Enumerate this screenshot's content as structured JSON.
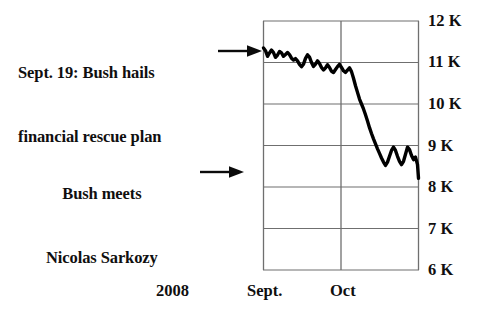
{
  "chart_data": {
    "type": "line",
    "title": "",
    "subtitle": "",
    "xlabel": "2008",
    "ylabel": "",
    "ylim": [
      6000,
      12000
    ],
    "ytick_labels": [
      "12 K",
      "11 K",
      "10 K",
      "9 K",
      "8 K",
      "7 K",
      "6 K"
    ],
    "ytick_values": [
      12000,
      11000,
      10000,
      9000,
      8000,
      7000,
      6000
    ],
    "xtick_labels": [
      "Sept.",
      "Oct"
    ],
    "grid": true,
    "legend": null,
    "line_color": "#000000",
    "series": [
      {
        "name": "Dow Jones Industrial Average",
        "x": [
          0.0,
          1.2,
          2.4,
          3.6,
          4.8,
          6.0,
          7.2,
          8.4,
          9.6,
          10.8,
          12.0,
          13.2,
          14.4,
          15.6,
          16.8,
          18.0,
          19.2,
          20.4,
          21.6,
          22.8,
          24.0,
          25.2,
          26.4,
          27.6,
          28.8,
          30.0,
          31.2,
          32.4,
          33.6,
          34.8,
          36.0,
          37.2,
          38.4,
          39.6,
          40.8,
          42.0,
          43.2,
          44.4,
          45.6,
          46.8,
          48.0,
          49.2,
          50.4,
          51.6,
          52.8,
          54.0,
          55.2,
          56.4,
          57.6,
          58.8,
          60.0,
          61.2,
          62.4,
          63.6,
          64.8,
          66.0,
          67.2,
          68.4,
          69.6,
          70.8,
          72.0,
          73.2,
          74.4,
          75.6,
          76.8,
          78.0,
          79.2,
          80.4,
          81.6,
          82.8,
          84.0,
          85.2,
          86.4,
          87.6,
          88.8,
          90.0,
          91.2,
          92.4,
          93.0
        ],
        "values": [
          11350,
          11285,
          11150,
          11230,
          11300,
          11240,
          11125,
          11180,
          11265,
          11230,
          11150,
          11195,
          11240,
          11190,
          11105,
          11060,
          11095,
          11040,
          10955,
          10900,
          10960,
          11100,
          11185,
          11130,
          11000,
          10905,
          10960,
          11040,
          10975,
          10880,
          10820,
          10870,
          10945,
          10880,
          10790,
          10760,
          10830,
          10900,
          10955,
          10880,
          10800,
          10760,
          10815,
          10870,
          10780,
          10620,
          10440,
          10280,
          10120,
          10000,
          9880,
          9740,
          9590,
          9430,
          9290,
          9160,
          9040,
          8920,
          8810,
          8700,
          8600,
          8520,
          8600,
          8740,
          8880,
          8960,
          8880,
          8740,
          8620,
          8540,
          8620,
          8790,
          8960,
          8900,
          8760,
          8660,
          8720,
          8540,
          8210
        ]
      }
    ],
    "annotations": [
      {
        "id": "rescue-plan",
        "text": "Sept. 19: Bush hails\nfinancial rescue plan",
        "lines": [
          "Sept. 19: Bush hails",
          "financial rescue plan"
        ],
        "arrow": "right-arrow-icon",
        "points_to_value": 11300
      },
      {
        "id": "sarkozy",
        "text": "Bush meets\nNicolas Sarkozy",
        "lines": [
          "Bush meets",
          "Nicolas Sarkozy"
        ],
        "arrow": "right-arrow-icon",
        "points_to_value": 8800
      }
    ]
  },
  "annotations": {
    "rescue_plan": {
      "line1": "Sept. 19: Bush hails",
      "line2": "financial rescue plan"
    },
    "sarkozy": {
      "line1": "Bush meets",
      "line2": "Nicolas Sarkozy"
    }
  },
  "axis": {
    "y_labels": [
      "12 K",
      "11 K",
      "10 K",
      "9 K",
      "8 K",
      "7 K",
      "6 K"
    ],
    "x_year": "2008",
    "x_sept": "Sept.",
    "x_oct": "Oct"
  }
}
